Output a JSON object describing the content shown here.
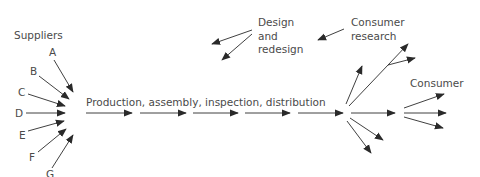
{
  "labels": {
    "suppliers": "Suppliers",
    "supplier_letters": [
      "A",
      "B",
      "C",
      "D",
      "E",
      "F",
      "G"
    ],
    "process": "Production, assembly, inspection, distribution",
    "design_line1": "Design",
    "design_line2": "and",
    "design_line3": "redesign",
    "research_line1": "Consumer",
    "research_line2": "research",
    "consumer": "Consumer"
  },
  "colors": {
    "arrow": "#2a2a2a",
    "text": "#4a4a4a",
    "background": "#ffffff"
  }
}
